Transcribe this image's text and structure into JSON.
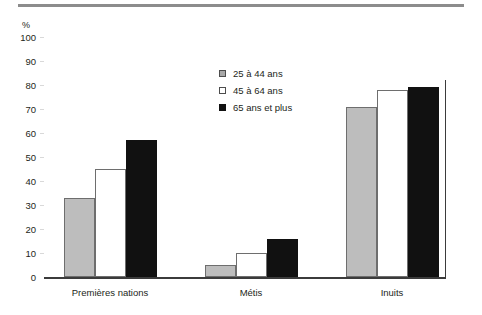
{
  "chart_data": {
    "type": "bar",
    "title": "",
    "subtitle": "",
    "xlabel": "",
    "ylabel": "%",
    "unit_label": "%",
    "ylim": [
      0,
      100
    ],
    "yticks": [
      100,
      90,
      80,
      70,
      60,
      50,
      40,
      30,
      20,
      10,
      0
    ],
    "ytick_labels": [
      "100",
      "90",
      "80",
      "70",
      "60",
      "50",
      "40",
      "30",
      "20",
      "10",
      "0"
    ],
    "grid": false,
    "legend_position": "upper-center",
    "categories": [
      "Premières nations",
      "Métis",
      "Inuits"
    ],
    "series": [
      {
        "name": "25 à 44 ans",
        "color": "#bdbdbd",
        "values": [
          33,
          5,
          71
        ]
      },
      {
        "name": "45 à 64 ans",
        "color": "#ffffff",
        "values": [
          45,
          10,
          78
        ]
      },
      {
        "name": "65 ans et plus",
        "color": "#111111",
        "values": [
          57,
          16,
          79
        ]
      }
    ],
    "annotations": []
  },
  "colors": {
    "series_25_44": "#bdbdbd",
    "series_45_64": "#ffffff",
    "series_65_plus": "#111111",
    "axis": "#3b3b3b",
    "top_rule": "#8c8c8c",
    "text": "#231f20"
  }
}
